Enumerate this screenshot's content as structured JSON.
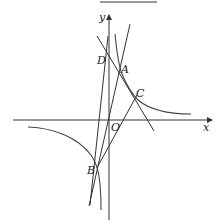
{
  "figure": {
    "axes": {
      "x_label": "x",
      "y_label": "y",
      "origin_label": "O"
    },
    "points": {
      "A": "A",
      "B": "B",
      "C": "C",
      "D": "D"
    },
    "curves": [
      "hyperbola-right-branch",
      "hyperbola-left-branch"
    ],
    "lines": [
      "line-DAC",
      "line-BC",
      "line-BD",
      "line-BA"
    ],
    "colors": {
      "ink": "#333333",
      "background": "#ffffff"
    }
  }
}
